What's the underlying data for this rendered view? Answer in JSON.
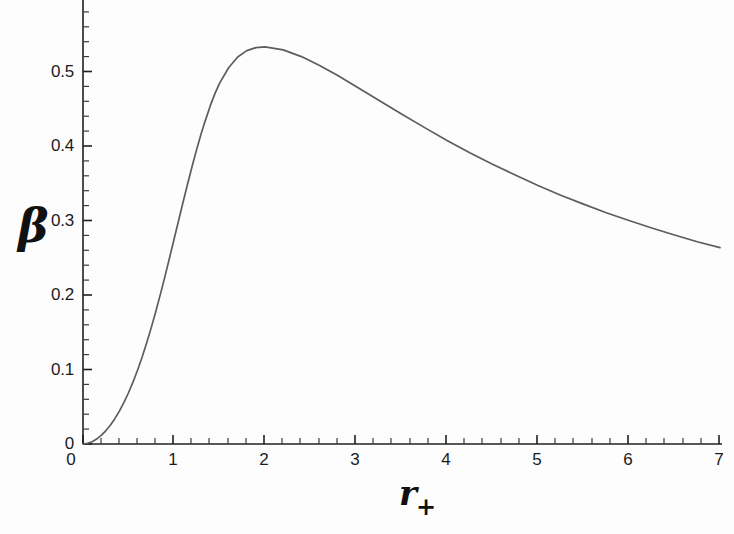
{
  "figure": {
    "background_color": "#fdfdfd",
    "axis_color": "#1f1f1f",
    "curve_color": "#5d5d5d"
  },
  "axes": {
    "x_label": "r",
    "x_label_subscript": "+",
    "y_label": "β",
    "x_tick_labels": [
      "0",
      "1",
      "2",
      "3",
      "4",
      "5",
      "6",
      "7"
    ],
    "y_tick_labels": [
      "0",
      "0.1",
      "0.2",
      "0.3",
      "0.4",
      "0.5"
    ]
  },
  "chart_data": {
    "type": "line",
    "title": "",
    "xlabel": "r+",
    "ylabel": "β",
    "xlim": [
      0,
      7
    ],
    "ylim": [
      0,
      0.585
    ],
    "xticks": [
      0,
      1,
      2,
      3,
      4,
      5,
      6,
      7
    ],
    "yticks": [
      0,
      0.1,
      0.2,
      0.3,
      0.4,
      0.5
    ],
    "minor_ticks_per_interval": 5,
    "grid": false,
    "legend": null,
    "peak": {
      "x": 1.33,
      "y": 0.573
    },
    "series": [
      {
        "name": "beta(r+)",
        "color": "#5d5d5d",
        "x": [
          0.0,
          0.05,
          0.1,
          0.15,
          0.2,
          0.25,
          0.3,
          0.35,
          0.4,
          0.45,
          0.5,
          0.55,
          0.6,
          0.65,
          0.7,
          0.75,
          0.8,
          0.85,
          0.9,
          0.95,
          1.0,
          1.05,
          1.1,
          1.15,
          1.2,
          1.25,
          1.3,
          1.33,
          1.4,
          1.45,
          1.5,
          1.6,
          1.7,
          1.8,
          1.9,
          2.0,
          2.2,
          2.4,
          2.6,
          2.8,
          3.0,
          3.25,
          3.5,
          3.75,
          4.0,
          4.25,
          4.5,
          4.75,
          5.0,
          5.25,
          5.5,
          5.75,
          6.0,
          6.25,
          6.5,
          6.75,
          7.0
        ],
        "y": [
          0.0,
          0.0008,
          0.003,
          0.0066,
          0.0115,
          0.0177,
          0.0252,
          0.034,
          0.0442,
          0.0558,
          0.0688,
          0.0833,
          0.0993,
          0.1168,
          0.1358,
          0.1562,
          0.1779,
          0.2008,
          0.2247,
          0.2494,
          0.2745,
          0.2997,
          0.3248,
          0.3493,
          0.3731,
          0.3958,
          0.417,
          0.429,
          0.4545,
          0.4703,
          0.484,
          0.505,
          0.5195,
          0.528,
          0.532,
          0.533,
          0.529,
          0.52,
          0.508,
          0.4945,
          0.48,
          0.4615,
          0.443,
          0.425,
          0.4075,
          0.391,
          0.3755,
          0.361,
          0.347,
          0.334,
          0.322,
          0.3105,
          0.3,
          0.29,
          0.2805,
          0.2715,
          0.2635
        ]
      }
    ],
    "note": "Curve rises steeply from the origin, attains a maximum of about 0.573 near r+ = 1.33, then decays monotonically to about 0.146 at r+ = 7."
  },
  "curve_points_pixels": {
    "description": "polyline in figure pixel coordinates (origin at 83,444; 90 px per x unit; 745 px per y unit)",
    "points": "83,444 86,443.5 89,442.5 92,441 95,438.8 98,435.8 101,432 104,427.4 107,422 110,415.8 113,408.8 116,401 119,392.5 122,383.3 125,373.4 128,362.9 131,351.8 134,340.2 137,328.2 140,315.8 143,303.1 146,290.2 149,277.2 152,264.2 155,251.3 158,238.6 161,226.2 164,214.2 167,202.6 170,191.5 173,181 176,171.1 179,161.9 182,153.4 185,145.7 188,138.8 191,132.7 194,127.4 197,23.0 200,19.5 203,17.0 206,16.5 209,17.6 212,20.2 215,24.2 218,29.4 221,35.7 224,43.0 227,51.2 230,60.1 233,69.6 236,79.6 239,90.0 242,100.7 245,111.6 248,122.6 251,133.6 254,144.6 257,155.4 260,166.1 263,176.5 266,186.7 269,196.6 272,206.2 275,215.5 278,224.5 281,233.1 284,241.4 287,249.4 290,257.0 293,264.3 296,271.3 299,278.0 302,284.4 305,290.5 308,296.4 311,302.0 314,307.3 317,312.4 320,317.3 323,322.0 326,326.4 329,330.7 332,334.8 335,338.7 338,342.4 341,346.0 344,349.4 347,352.7 350,355.8 353,358.8 356,361.7 359,364.5 362,367.1 365,369.7 368,372.2 371,374.5 374,376.8 377,379.0 380,381.1 383,383.1 386,385.1 389,387.0 392,388.8 395,390.6 398,392.3 401,393.9 404,395.5 407,397.1 410,398.6 413,400.0 416,401.4 419,402.8 422,404.1 425,405.4 428,406.6 431,407.8 434,409.0 437,410.1 440,411.2 443,412.3 446,413.3 449,414.3 452,415.3 455,416.2 458,417.2 461,418.1 464,418.9 467,419.8 470,420.6 473,421.4 476,422.2 479,423.0 482,423.7 485,424.5 488,425.2 491,425.9 494,426.5 497,427.2 500,427.8 503,428.5 506,429.1 509,429.7 512,430.3 515,430.8 518,431.4 521,431.9 524,432.5 527,433.0 530,433.5 533,434.0 536,434.5 539,435.0 542,435.4 545,435.9 548,436.3 551,436.8 554,437.2 557,437.6 560,438.0 563,438.4 566,438.8 569,439.2 572,439.6 575,439.9 578,440.3 581,440.7 584,441.0 587,441.3 590,441.7 593,442.0 596,442.3 599,442.6 602,442.9 605,443.2 608,443.5 611,443.8 614,444.1 617,444.4 620,444.6"
  }
}
